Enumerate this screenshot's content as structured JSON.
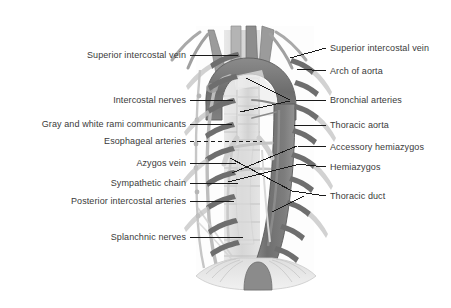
{
  "figure": {
    "background_color": "#ffffff",
    "text_color": "#3a3a3a",
    "leader_color": "#1a1a1a",
    "palette": {
      "aorta_fill": "#7b7b7b",
      "aorta_dark": "#6a6a6a",
      "aorta_light": "#9a9a9a",
      "vessel_stub": "#6f6f6f",
      "rib_stub": "#707070",
      "azygos": "#b9b9b9",
      "vertebrae": "#cfcfcf",
      "trachea": "#dcdcdc",
      "diaphragm": "#d6d6d6",
      "outline": "#5c5c5c"
    }
  },
  "labels_left": [
    {
      "id": "superior-intercostal-vein",
      "text": "Superior intercostal vein",
      "text_x": 186,
      "text_y": 55,
      "leader": [
        [
          190,
          55
        ],
        [
          238,
          55
        ]
      ],
      "dashed": false
    },
    {
      "id": "intercostal-nerves",
      "text": "Intercostal nerves",
      "text_x": 186,
      "text_y": 100,
      "leader": [
        [
          190,
          100
        ],
        [
          233,
          100
        ]
      ],
      "dashed": false
    },
    {
      "id": "gray-and-white-rami-communicants",
      "text": "Gray and white rami communicants",
      "text_x": 186,
      "text_y": 124,
      "leader": [
        [
          190,
          124
        ],
        [
          232,
          124
        ]
      ],
      "dashed": false
    },
    {
      "id": "esophageal-arteries",
      "text": "Esophageal arteries",
      "text_x": 186,
      "text_y": 141,
      "leader": [
        [
          190,
          141
        ],
        [
          262,
          141
        ]
      ],
      "dashed": true
    },
    {
      "id": "azygos-vein",
      "text": "Azygos vein",
      "text_x": 186,
      "text_y": 163,
      "leader": [
        [
          190,
          163
        ],
        [
          236,
          163
        ]
      ],
      "dashed": false
    },
    {
      "id": "sympathetic-chain",
      "text": "Sympathetic chain",
      "text_x": 186,
      "text_y": 183,
      "leader": [
        [
          190,
          183
        ],
        [
          238,
          183
        ]
      ],
      "dashed": false
    },
    {
      "id": "posterior-intercostal-arteries",
      "text": "Posterior intercostal arteries",
      "text_x": 186,
      "text_y": 201,
      "leader": [
        [
          190,
          201
        ],
        [
          234,
          201
        ]
      ],
      "dashed": false
    },
    {
      "id": "splanchnic-nerves",
      "text": "Splanchnic nerves",
      "text_x": 186,
      "text_y": 237,
      "leader": [
        [
          190,
          237
        ],
        [
          243,
          237
        ]
      ],
      "dashed": false
    }
  ],
  "labels_right": [
    {
      "id": "superior-intercostal-vein-right",
      "text": "Superior intercostal vein",
      "text_x": 330,
      "text_y": 48,
      "leader": [
        [
          326,
          48
        ],
        [
          290,
          58
        ]
      ],
      "dashed": false
    },
    {
      "id": "arch-of-aorta",
      "text": "Arch of aorta",
      "text_x": 330,
      "text_y": 71,
      "leader": [
        [
          326,
          71
        ],
        [
          297,
          69
        ]
      ],
      "dashed": false
    },
    {
      "id": "bronchial-arteries",
      "text": "Bronchial arteries",
      "text_x": 330,
      "text_y": 100,
      "leader": [
        [
          326,
          100
        ],
        [
          296,
          100
        ]
      ],
      "dashed": false
    },
    {
      "id": "thoracic-aorta",
      "text": "Thoracic aorta",
      "text_x": 330,
      "text_y": 125,
      "leader": [
        [
          326,
          125
        ],
        [
          294,
          125
        ]
      ],
      "dashed": false
    },
    {
      "id": "accessory-hemiazygos",
      "text": "Accessory hemiazygos",
      "text_x": 330,
      "text_y": 147,
      "leader": [
        [
          326,
          147
        ],
        [
          298,
          146
        ]
      ],
      "dashed": false
    },
    {
      "id": "hemiazygos",
      "text": "Hemiazygos",
      "text_x": 330,
      "text_y": 167,
      "leader": [
        [
          326,
          167
        ],
        [
          296,
          164
        ]
      ],
      "dashed": false
    },
    {
      "id": "thoracic-duct",
      "text": "Thoracic duct",
      "text_x": 330,
      "text_y": 196,
      "leader": [
        [
          326,
          196
        ],
        [
          292,
          191
        ]
      ],
      "dashed": false
    }
  ],
  "internal_leaders": [
    {
      "id": "bronchial-arteries-pointer-a",
      "path": [
        [
          290,
          100
        ],
        [
          246,
          78
        ]
      ]
    },
    {
      "id": "bronchial-arteries-pointer-b",
      "path": [
        [
          290,
          101
        ],
        [
          240,
          112
        ]
      ]
    },
    {
      "id": "accessory-hemiazygos-pointer",
      "path": [
        [
          297,
          146
        ],
        [
          232,
          173
        ]
      ]
    },
    {
      "id": "hemiazygos-pointer",
      "path": [
        [
          296,
          165
        ],
        [
          228,
          182
        ]
      ]
    },
    {
      "id": "thoracic-duct-pointer",
      "path": [
        [
          292,
          191
        ],
        [
          230,
          158
        ]
      ]
    },
    {
      "id": "thoracic-duct-free-tick",
      "path": [
        [
          272,
          212
        ],
        [
          304,
          196
        ]
      ]
    }
  ]
}
